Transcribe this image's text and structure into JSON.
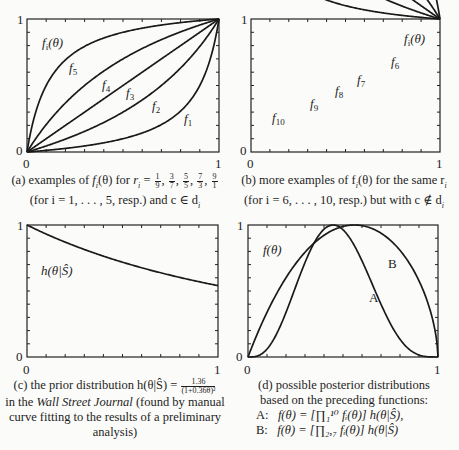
{
  "figure": {
    "panels": [
      {
        "id": "a",
        "curve_label_main": "f_i(θ)",
        "caption_prefix": "(a) examples of",
        "caption_fn": "f",
        "caption_fn_sub": "i",
        "caption_fn_arg": "(θ) for",
        "caption_r": "r",
        "caption_r_sub": "i",
        "caption_eq": "=",
        "caption_fractions": [
          {
            "num": "1",
            "den": "9"
          },
          {
            "num": "3",
            "den": "7"
          },
          {
            "num": "5",
            "den": "5"
          },
          {
            "num": "7",
            "den": "3"
          },
          {
            "num": "9",
            "den": "1"
          }
        ],
        "caption_line2": "(for i = 1, . . . , 5, resp.) and c ∈ d",
        "caption_line2_sub": "i",
        "curve_labels": [
          "f5",
          "f4",
          "f3",
          "f2",
          "f1"
        ]
      },
      {
        "id": "b",
        "curve_label_main": "f_i(θ)",
        "caption_line1": "(b) more examples of f",
        "caption_line1_sub": "i",
        "caption_line1_rest": "(θ) for the same r",
        "caption_line1_sub2": "i",
        "caption_line2": "(for i = 6, . . . , 10, resp.) but with c ∉ d",
        "caption_line2_sub": "i",
        "curve_labels": [
          "f6",
          "f7",
          "f8",
          "f9",
          "f10"
        ]
      },
      {
        "id": "c",
        "curve_label_main": "h(θ|Ŝ)",
        "caption_line1": "(c) the prior distribution h(θ|Ŝ) =",
        "caption_frac_num": "1.36",
        "caption_frac_den": "(1+0.36θ)²",
        "caption_line2_pre": "in the",
        "caption_line2_ital": "Wall Street Journal",
        "caption_line2_post": "(found by manual",
        "caption_line3": "curve fitting to the results of a preliminary",
        "caption_line4": "analysis)"
      },
      {
        "id": "d",
        "curve_label_main": "f(θ)",
        "curve_labels": [
          "A",
          "B"
        ],
        "caption_line1": "(d) possible posterior distributions",
        "caption_line2": "based on the preceding functions:",
        "formula_a_label": "A:",
        "formula_a": "f(θ) = [∏₁¹⁰ fᵢ(θ)] h(θ|Ŝ),",
        "formula_b_label": "B:",
        "formula_b": "f(θ) = [∏₂,₇ fᵢ(θ)] h(θ|Ŝ)"
      }
    ],
    "axis": {
      "x_min": "0",
      "x_max": "1",
      "y_min": "0",
      "y_max": "1"
    }
  },
  "chart_data": [
    {
      "type": "line",
      "title": "(a) examples of f_i(θ) for r_i = 1/9, 3/7, 5/5, 7/3, 9/1 (i = 1..5) and c ∈ d_i",
      "xlabel": "θ",
      "ylabel": "f_i(θ)",
      "xlim": [
        0,
        1
      ],
      "ylim": [
        0,
        1
      ],
      "series": [
        {
          "name": "f1",
          "r": 9.0,
          "x": [
            0,
            0.25,
            0.5,
            0.75,
            1
          ],
          "values": [
            0,
            0.04,
            0.1,
            0.25,
            1
          ]
        },
        {
          "name": "f2",
          "r": 2.333,
          "x": [
            0,
            0.25,
            0.5,
            0.75,
            1
          ],
          "values": [
            0,
            0.13,
            0.3,
            0.56,
            1
          ]
        },
        {
          "name": "f3",
          "r": 1.0,
          "x": [
            0,
            0.25,
            0.5,
            0.75,
            1
          ],
          "values": [
            0,
            0.25,
            0.5,
            0.75,
            1
          ]
        },
        {
          "name": "f4",
          "r": 0.4286,
          "x": [
            0,
            0.25,
            0.5,
            0.75,
            1
          ],
          "values": [
            0,
            0.44,
            0.7,
            0.88,
            1
          ]
        },
        {
          "name": "f5",
          "r": 0.1111,
          "x": [
            0,
            0.25,
            0.5,
            0.75,
            1
          ],
          "values": [
            0,
            0.75,
            0.9,
            0.96,
            1
          ]
        }
      ],
      "ticks": "x every 0.1, y every 0.1",
      "grid": false
    },
    {
      "type": "line",
      "title": "(b) more examples of f_i(θ) for the same r_i (i = 6..10) but with c ∉ d_i",
      "xlabel": "θ",
      "ylabel": "f_i(θ)",
      "xlim": [
        0,
        1
      ],
      "ylim": [
        0,
        1
      ],
      "series": [
        {
          "name": "f6",
          "x": [
            0,
            0.25,
            0.5,
            0.75,
            1
          ],
          "values": [
            1,
            0.96,
            0.9,
            0.75,
            0
          ]
        },
        {
          "name": "f7",
          "x": [
            0,
            0.25,
            0.5,
            0.75,
            1
          ],
          "values": [
            1,
            0.88,
            0.7,
            0.44,
            0
          ]
        },
        {
          "name": "f8",
          "x": [
            0,
            0.25,
            0.5,
            0.75,
            1
          ],
          "values": [
            1,
            0.75,
            0.5,
            0.25,
            0
          ]
        },
        {
          "name": "f9",
          "x": [
            0,
            0.25,
            0.5,
            0.75,
            1
          ],
          "values": [
            1,
            0.56,
            0.3,
            0.13,
            0
          ]
        },
        {
          "name": "f10",
          "x": [
            0,
            0.25,
            0.5,
            0.75,
            1
          ],
          "values": [
            1,
            0.25,
            0.1,
            0.04,
            0
          ]
        }
      ],
      "grid": false
    },
    {
      "type": "line",
      "title": "(c) the prior distribution h(θ|Ŝ) = 1.36/(1+0.36θ)²",
      "xlabel": "θ",
      "ylabel": "h(θ|Ŝ)",
      "xlim": [
        0,
        1
      ],
      "ylim": [
        0,
        1
      ],
      "series": [
        {
          "name": "h(θ|Ŝ)",
          "x": [
            0,
            0.25,
            0.5,
            0.75,
            1
          ],
          "values": [
            1.0,
            0.84,
            0.72,
            0.62,
            0.54
          ]
        }
      ],
      "grid": false
    },
    {
      "type": "line",
      "title": "(d) possible posterior distributions",
      "xlabel": "θ",
      "ylabel": "f(θ)",
      "xlim": [
        0,
        1
      ],
      "ylim": [
        0,
        1
      ],
      "series": [
        {
          "name": "A",
          "x": [
            0,
            0.1,
            0.2,
            0.3,
            0.4,
            0.48,
            0.6,
            0.7,
            0.8,
            0.9,
            1
          ],
          "values": [
            0,
            0.03,
            0.3,
            0.7,
            0.95,
            1.0,
            0.82,
            0.48,
            0.15,
            0.01,
            0
          ]
        },
        {
          "name": "B",
          "x": [
            0,
            0.1,
            0.2,
            0.3,
            0.4,
            0.5,
            0.63,
            0.7,
            0.8,
            0.9,
            1
          ],
          "values": [
            0,
            0.25,
            0.48,
            0.7,
            0.86,
            0.96,
            1.0,
            0.97,
            0.83,
            0.52,
            0
          ]
        }
      ],
      "grid": false
    }
  ]
}
